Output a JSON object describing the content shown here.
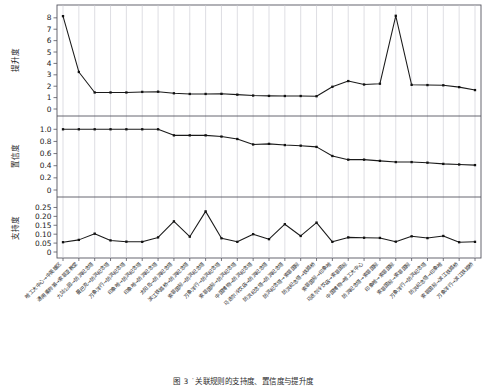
{
  "figure": {
    "caption_label": "图 3",
    "caption_text": "̇关联规则的支持度、置信度与提升度",
    "background_color": "#ffffff",
    "line_color": "#1a1a1a",
    "marker_color": "#111111",
    "grid_color": "#c8c8d0",
    "axis_color": "#555560"
  },
  "chart_data": {
    "type": "line",
    "title": "",
    "xlabel": "",
    "grid": true,
    "legend": "none",
    "panels": [
      {
        "name": "lift-panel",
        "ylabel": "提升度",
        "ylim": [
          0,
          8.6
        ],
        "yticks": [
          0,
          1,
          2,
          3,
          4,
          5,
          6,
          7,
          8
        ],
        "ytick_labels": [
          "0",
          "1",
          "2",
          "3",
          "4",
          "5",
          "6",
          "7",
          "8"
        ],
        "values": [
          8.15,
          3.25,
          1.45,
          1.45,
          1.45,
          1.5,
          1.52,
          1.38,
          1.32,
          1.32,
          1.33,
          1.26,
          1.18,
          1.15,
          1.14,
          1.14,
          1.12,
          1.95,
          2.45,
          2.15,
          2.22,
          8.18,
          2.12,
          2.1,
          2.08,
          1.92,
          1.66
        ]
      },
      {
        "name": "confidence-panel",
        "ylabel": "置信度",
        "ylim": [
          0,
          1.12
        ],
        "yticks": [
          0,
          0.2,
          0.4,
          0.6,
          0.8,
          1.0
        ],
        "ytick_labels": [
          "0",
          "0.2",
          "0.4",
          "0.6",
          "0.8",
          "1.0"
        ],
        "values": [
          1.0,
          1.0,
          1.0,
          1.0,
          1.0,
          1.0,
          1.0,
          0.9,
          0.9,
          0.9,
          0.88,
          0.84,
          0.75,
          0.76,
          0.74,
          0.73,
          0.71,
          0.56,
          0.5,
          0.5,
          0.48,
          0.46,
          0.46,
          0.45,
          0.43,
          0.42,
          0.41
        ]
      },
      {
        "name": "support-panel",
        "ylabel": "支持度",
        "ylim": [
          0,
          0.275
        ],
        "yticks": [
          0,
          0.05,
          0.1,
          0.15,
          0.2,
          0.25
        ],
        "ytick_labels": [
          "0",
          "0.05",
          "0.10",
          "0.15",
          "0.20",
          "0.25"
        ],
        "values": [
          0.055,
          0.068,
          0.103,
          0.065,
          0.058,
          0.057,
          0.082,
          0.172,
          0.086,
          0.228,
          0.077,
          0.057,
          0.1,
          0.072,
          0.156,
          0.09,
          0.165,
          0.057,
          0.082,
          0.08,
          0.079,
          0.058,
          0.088,
          0.078,
          0.09,
          0.055,
          0.057
        ]
      }
    ],
    "categories": [
      "哈工大中心→中英雄区",
      "通用乘称第→索菲亚教堂",
      "九站公园→防洪纪念塔",
      "曼巴克→防洪纪念塔",
      "万象洋行→防洪纪念塔",
      "印象哈→防洪纪念塔",
      "印象哈→防洪纪念塔",
      "太阳岛→防洪纪念塔",
      "滨江铁路桥→防洪纪念塔",
      "索菲国际→防洪纪念塔",
      "万象洋行→防洪纪念塔",
      "索菲国际→防洪纪念塔",
      "中国博物→防洪纪念塔",
      "马迭尔冷饮店→防洪纪念塔",
      "防洪纪念塔→防洪纪念塔",
      "防洪纪念塔→索菲国际",
      "防洪纪念塔→铁路桥",
      "索菲国际→印象哈",
      "马迭尔冷饮店→索菲国际",
      "中国博物→哈工大中心",
      "防洪纪念塔→索菲国际",
      "印象哈→索菲国际",
      "索菲国际→索菲国际",
      "万象洋行→防洪纪念塔",
      "防洪纪念塔→印象哈",
      "索菲国际→滨江铁路桥",
      "万象洋行→滨江铁路桥"
    ],
    "xtick_rotation": -45,
    "n_points": 27
  }
}
